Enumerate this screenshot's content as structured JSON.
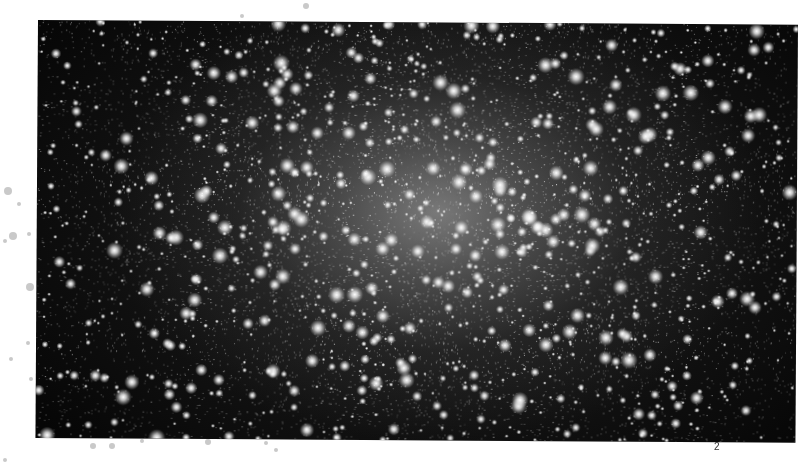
{
  "page": {
    "page_number": "2",
    "background": "#ffffff"
  },
  "image": {
    "subject": "globular star cluster",
    "palette": {
      "sky": "#050505",
      "core_glow": "#969696",
      "star": "#ffffff"
    },
    "star_field": {
      "seed": 1337,
      "faint_count": 14000,
      "bright_count": 1500,
      "core_x": 400,
      "core_y": 190
    }
  },
  "margin_dots": [
    {
      "x": 8,
      "y": 191,
      "r": 4
    },
    {
      "x": 19,
      "y": 204,
      "r": 2
    },
    {
      "x": 13,
      "y": 236,
      "r": 4
    },
    {
      "x": 5,
      "y": 241,
      "r": 2
    },
    {
      "x": 29,
      "y": 234,
      "r": 2
    },
    {
      "x": 30,
      "y": 287,
      "r": 4
    },
    {
      "x": 28,
      "y": 343,
      "r": 2
    },
    {
      "x": 11,
      "y": 359,
      "r": 2
    },
    {
      "x": 31,
      "y": 379,
      "r": 2
    },
    {
      "x": 93,
      "y": 446,
      "r": 3
    },
    {
      "x": 112,
      "y": 446,
      "r": 3
    },
    {
      "x": 142,
      "y": 441,
      "r": 2
    },
    {
      "x": 208,
      "y": 442,
      "r": 3
    },
    {
      "x": 266,
      "y": 443,
      "r": 2
    },
    {
      "x": 276,
      "y": 450,
      "r": 2
    },
    {
      "x": 242,
      "y": 16,
      "r": 2
    },
    {
      "x": 306,
      "y": 6,
      "r": 3
    },
    {
      "x": 5,
      "y": 460,
      "r": 2
    }
  ]
}
